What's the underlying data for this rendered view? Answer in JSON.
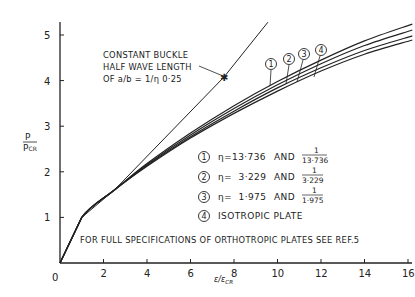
{
  "chart_data": {
    "type": "line",
    "title": "",
    "xlabel": "ε/ε_CR",
    "ylabel": "P/P_CR",
    "xlim": [
      0,
      16.2
    ],
    "ylim": [
      0,
      5.3
    ],
    "grid": false,
    "x_ticks": [
      "0",
      "2",
      "4",
      "6",
      "8",
      "10",
      "12",
      "14",
      "16"
    ],
    "y_ticks": [
      "0",
      "1",
      "2",
      "3",
      "4",
      "5"
    ],
    "series": [
      {
        "name": "Constant buckle half wave length",
        "style": "straight",
        "x": [
          0,
          1.0,
          2.5,
          7.54,
          9.56
        ],
        "y": [
          0,
          1.0,
          1.6,
          4.08,
          5.28
        ]
      },
      {
        "name": "1: η=13.736 and 1/13.736",
        "x": [
          0,
          1.0,
          2.5,
          4,
          6,
          8,
          10,
          12,
          14,
          16.2
        ],
        "y": [
          0,
          1.0,
          1.6,
          2.18,
          2.85,
          3.45,
          3.98,
          4.45,
          4.87,
          5.24
        ]
      },
      {
        "name": "2: η=3.229 and 1/3.229",
        "x": [
          0,
          1.0,
          2.5,
          4,
          6,
          8,
          10,
          12,
          14,
          16.2
        ],
        "y": [
          0,
          1.0,
          1.6,
          2.16,
          2.81,
          3.39,
          3.91,
          4.37,
          4.77,
          5.11
        ]
      },
      {
        "name": "3: η=1.975 and 1/1.975",
        "x": [
          0,
          1.0,
          2.5,
          4,
          6,
          8,
          10,
          12,
          14,
          16.2
        ],
        "y": [
          0,
          1.0,
          1.6,
          2.14,
          2.77,
          3.33,
          3.84,
          4.28,
          4.66,
          4.98
        ]
      },
      {
        "name": "4: Isotropic plate",
        "x": [
          0,
          1.0,
          2.5,
          4,
          6,
          8,
          10,
          12,
          14,
          16.2
        ],
        "y": [
          0,
          1.0,
          1.6,
          2.12,
          2.74,
          3.28,
          3.77,
          4.21,
          4.58,
          4.89
        ]
      }
    ],
    "annotations": [
      "CONSTANT BUCKLE",
      "HALF WAVE LENGTH",
      "OF a/b = 1/η 0·25",
      "FOR FULL SPECIFICATIONS OF ORTHOTROPIC PLATES SEE REF.5"
    ],
    "legend": [
      {
        "marker": "1",
        "eta": "η=13·736",
        "and": "AND",
        "num": "1",
        "den": "13·736"
      },
      {
        "marker": "2",
        "eta": "η=  3·229",
        "and": "AND",
        "num": "1",
        "den": "3·229"
      },
      {
        "marker": "3",
        "eta": "η=  1·975",
        "and": "AND",
        "num": "1",
        "den": "1·975"
      },
      {
        "marker": "4",
        "text": "ISOTROPIC PLATE"
      }
    ],
    "legend_position": "inside-lower-right"
  },
  "axes": {
    "ylabel_num": "P",
    "ylabel_den": "P",
    "ylabel_sub": "CR",
    "xlabel_num": "ε",
    "xlabel_den": "ε",
    "xlabel_sub": "CR"
  },
  "colors": {
    "ink": "#222222",
    "background": "#ffffff"
  }
}
